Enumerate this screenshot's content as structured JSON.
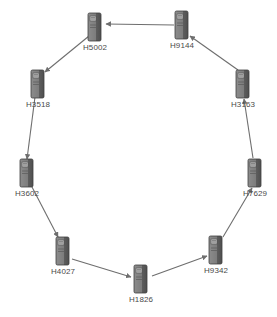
{
  "diagram": {
    "background_color": "#ffffff",
    "node_color": "#7a7a7a",
    "node_shadow_color": "#4f4f4f",
    "edge_color": "#6e6e6e",
    "label_color": "#4a4a4a",
    "icon_name": "server-tower-icon",
    "nodes": [
      {
        "id": "H5002",
        "label": "H5002",
        "x": 95,
        "y": 27
      },
      {
        "id": "H9144",
        "label": "H9144",
        "x": 182,
        "y": 25
      },
      {
        "id": "H3163",
        "label": "H3163",
        "x": 243,
        "y": 84
      },
      {
        "id": "H7629",
        "label": "H7629",
        "x": 255,
        "y": 173
      },
      {
        "id": "H9342",
        "label": "H9342",
        "x": 216,
        "y": 250
      },
      {
        "id": "H1826",
        "label": "H1826",
        "x": 141,
        "y": 279
      },
      {
        "id": "H4027",
        "label": "H4027",
        "x": 63,
        "y": 251
      },
      {
        "id": "H3602",
        "label": "H3602",
        "x": 27,
        "y": 173
      },
      {
        "id": "H3518",
        "label": "H3518",
        "x": 38,
        "y": 84
      },
      {
        "id": "H5002b",
        "label": "",
        "x": 0,
        "y": 0
      }
    ],
    "edges": [
      {
        "from": "H9144",
        "to": "H5002",
        "x1": 174,
        "y1": 25,
        "x2": 106,
        "y2": 24
      },
      {
        "from": "H5002",
        "to": "H3518",
        "x1": 89,
        "y1": 36,
        "x2": 45,
        "y2": 72
      },
      {
        "from": "H3518",
        "to": "H3602",
        "x1": 35,
        "y1": 97,
        "x2": 27,
        "y2": 159
      },
      {
        "from": "H3602",
        "to": "H4027",
        "x1": 32,
        "y1": 187,
        "x2": 58,
        "y2": 237
      },
      {
        "from": "H4027",
        "to": "H1826",
        "x1": 72,
        "y1": 259,
        "x2": 131,
        "y2": 277
      },
      {
        "from": "H1826",
        "to": "H9342",
        "x1": 152,
        "y1": 276,
        "x2": 207,
        "y2": 256
      },
      {
        "from": "H9342",
        "to": "H7629",
        "x1": 223,
        "y1": 237,
        "x2": 252,
        "y2": 188
      },
      {
        "from": "H7629",
        "to": "H3163",
        "x1": 253,
        "y1": 158,
        "x2": 244,
        "y2": 99
      },
      {
        "from": "H3163",
        "to": "H9144",
        "x1": 238,
        "y1": 70,
        "x2": 190,
        "y2": 36
      }
    ]
  }
}
